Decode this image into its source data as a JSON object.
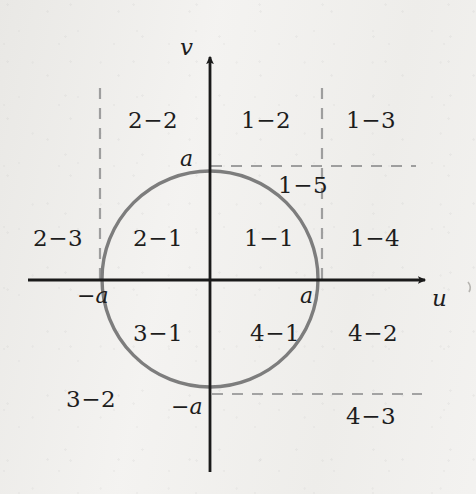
{
  "figure": {
    "background_color": "#f3f2f0",
    "axis_color": "#1a1a1a",
    "circle_color": "#7d7d7d",
    "dash_color": "#9a9a9a",
    "text_color": "#1d1d1d"
  },
  "axes": {
    "horizontal": {
      "name": "u",
      "label": "u"
    },
    "vertical": {
      "name": "v",
      "label": "v"
    },
    "ticks": {
      "u_positive": "a",
      "u_negative": "−a",
      "v_positive": "a",
      "v_negative": "−a"
    }
  },
  "circle": {
    "center_label": "origin",
    "radius_label": "a"
  },
  "regions": [
    {
      "id": "r-2-2",
      "label": "2−2",
      "x": 128,
      "y": 107
    },
    {
      "id": "r-1-2",
      "label": "1−2",
      "x": 241,
      "y": 107
    },
    {
      "id": "r-1-3",
      "label": "1−3",
      "x": 346,
      "y": 107
    },
    {
      "id": "r-1-5",
      "label": "1−5",
      "x": 278,
      "y": 172
    },
    {
      "id": "r-2-3",
      "label": "2−3",
      "x": 33,
      "y": 225
    },
    {
      "id": "r-2-1",
      "label": "2−1",
      "x": 133,
      "y": 225
    },
    {
      "id": "r-1-1",
      "label": "1−1",
      "x": 244,
      "y": 225
    },
    {
      "id": "r-1-4",
      "label": "1−4",
      "x": 350,
      "y": 225
    },
    {
      "id": "r-3-1",
      "label": "3−1",
      "x": 133,
      "y": 320
    },
    {
      "id": "r-4-1",
      "label": "4−1",
      "x": 250,
      "y": 320
    },
    {
      "id": "r-4-2",
      "label": "4−2",
      "x": 348,
      "y": 320
    },
    {
      "id": "r-3-2",
      "label": "3−2",
      "x": 66,
      "y": 386
    },
    {
      "id": "r-4-3",
      "label": "4−3",
      "x": 346,
      "y": 403
    }
  ],
  "tick_labels": [
    {
      "id": "tick-v-a",
      "label": "a",
      "x": 180,
      "y": 146
    },
    {
      "id": "tick-u-neg-a",
      "label": "−a",
      "x": 77,
      "y": 283
    },
    {
      "id": "tick-u-a",
      "label": "a",
      "x": 300,
      "y": 283
    },
    {
      "id": "tick-v-neg-a",
      "label": "−a",
      "x": 171,
      "y": 394
    }
  ],
  "axis_name_labels": [
    {
      "id": "axis-name-v",
      "label": "v",
      "x": 180,
      "y": 34
    },
    {
      "id": "axis-name-u",
      "label": "u",
      "x": 432,
      "y": 285
    }
  ],
  "geometry": {
    "origin_x": 210,
    "origin_y": 280,
    "radius": 108,
    "u_axis_start_x": 28,
    "u_axis_end_x": 432,
    "v_axis_top_y": 50,
    "v_axis_bottom_y": 472,
    "dash_vertical_left_x": 100,
    "dash_vertical_right_x": 322,
    "dash_vertical_top_y": 88,
    "dash_horizontal_top_y": 166,
    "dash_horizontal_top_x2": 416,
    "dash_horizontal_bottom_y": 394,
    "dash_horizontal_bottom_x2": 422
  }
}
